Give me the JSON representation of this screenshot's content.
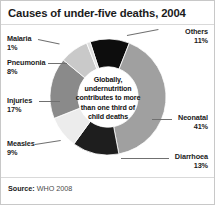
{
  "title": "Causes of under-five deaths, 2004",
  "source": {
    "label": "Source:",
    "value": "WHO 2008"
  },
  "center_note": {
    "lines": [
      "Globally,",
      "undernutrition",
      "contributes to more",
      "than one third of",
      "child deaths"
    ]
  },
  "labels": {
    "others": {
      "name": "Others",
      "pct": "11%"
    },
    "neonatal": {
      "name": "Neonatal",
      "pct": "41%"
    },
    "diarrhoea": {
      "name": "Diarrhoea",
      "pct": "13%"
    },
    "measles": {
      "name": "Measles",
      "pct": "9%"
    },
    "injuries": {
      "name": "Injuries",
      "pct": "17%"
    },
    "pneumonia": {
      "name": "Pneumonia",
      "pct": "8%"
    },
    "malaria": {
      "name": "Malaria",
      "pct": "1%"
    }
  },
  "chart_data": {
    "type": "pie",
    "title": "Causes of under-five deaths, 2004",
    "subtitle": "",
    "xlabel": "",
    "ylabel": "",
    "donut": true,
    "hole_ratio": 0.52,
    "units": "percent of under-five deaths",
    "legend": "none-labels-with-leader-lines",
    "grid": false,
    "start_angle_deg": -18,
    "direction": "clockwise",
    "categories": [
      "Others",
      "Neonatal",
      "Diarrhoea",
      "Measles",
      "Injuries",
      "Pneumonia",
      "Malaria"
    ],
    "values": [
      11,
      41,
      13,
      9,
      17,
      8,
      1
    ],
    "colors": [
      "#0d0d0d",
      "#a0a0a0",
      "#1e1e1e",
      "#ececec",
      "#8a8a8a",
      "#c9c9c9",
      "#dedede"
    ],
    "slices": [
      {
        "label": "Others",
        "value": 11,
        "color": "#0d0d0d"
      },
      {
        "label": "Neonatal",
        "value": 41,
        "color": "#a0a0a0"
      },
      {
        "label": "Diarrhoea",
        "value": 13,
        "color": "#1e1e1e"
      },
      {
        "label": "Measles",
        "value": 9,
        "color": "#ececec"
      },
      {
        "label": "Injuries",
        "value": 17,
        "color": "#8a8a8a"
      },
      {
        "label": "Pneumonia",
        "value": 8,
        "color": "#c9c9c9"
      },
      {
        "label": "Malaria",
        "value": 1,
        "color": "#dedede"
      }
    ],
    "annotation": "Globally, undernutrition contributes to more than one third of child deaths",
    "source": "Source: WHO 2008"
  }
}
